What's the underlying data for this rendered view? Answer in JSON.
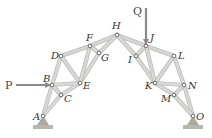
{
  "figure": {
    "type": "truss",
    "colors": {
      "member": "#d6d8d4",
      "member_edge": "#b7b9b4",
      "node": "#ffffff",
      "node_edge": "#555555",
      "arrow": "#8a8a8a",
      "support": "#a9a9a2",
      "ground": "#b8b6ad"
    },
    "nodes": [
      {
        "id": "A",
        "label": "A",
        "x": 43,
        "y": 116,
        "lx": 33,
        "ly": 120
      },
      {
        "id": "B",
        "label": "B",
        "x": 52,
        "y": 85,
        "lx": 43,
        "ly": 82
      },
      {
        "id": "C",
        "label": "C",
        "x": 61,
        "y": 95,
        "lx": 64,
        "ly": 102
      },
      {
        "id": "D",
        "label": "D",
        "x": 61,
        "y": 56,
        "lx": 51,
        "ly": 59
      },
      {
        "id": "E",
        "label": "E",
        "x": 80,
        "y": 83,
        "lx": 83,
        "ly": 89
      },
      {
        "id": "F",
        "label": "F",
        "x": 90,
        "y": 46,
        "lx": 86,
        "ly": 41
      },
      {
        "id": "G",
        "label": "G",
        "x": 99,
        "y": 53,
        "lx": 101,
        "ly": 61
      },
      {
        "id": "H",
        "label": "H",
        "x": 117,
        "y": 35,
        "lx": 112,
        "ly": 29
      },
      {
        "id": "I",
        "label": "I",
        "x": 136,
        "y": 56,
        "lx": 128,
        "ly": 63
      },
      {
        "id": "J",
        "label": "J",
        "x": 146,
        "y": 46,
        "lx": 150,
        "ly": 41
      },
      {
        "id": "K",
        "label": "K",
        "x": 155,
        "y": 83,
        "lx": 145,
        "ly": 89
      },
      {
        "id": "L",
        "label": "L",
        "x": 174,
        "y": 56,
        "lx": 178,
        "ly": 59
      },
      {
        "id": "M",
        "label": "M",
        "x": 174,
        "y": 95,
        "lx": 161,
        "ly": 102
      },
      {
        "id": "N",
        "label": "N",
        "x": 184,
        "y": 85,
        "lx": 188,
        "ly": 89
      },
      {
        "id": "O",
        "label": "O",
        "x": 193,
        "y": 116,
        "lx": 196,
        "ly": 120
      }
    ],
    "members": [
      [
        "A",
        "B"
      ],
      [
        "B",
        "D"
      ],
      [
        "D",
        "F"
      ],
      [
        "F",
        "H"
      ],
      [
        "H",
        "J"
      ],
      [
        "J",
        "L"
      ],
      [
        "L",
        "N"
      ],
      [
        "N",
        "O"
      ],
      [
        "A",
        "C"
      ],
      [
        "C",
        "E"
      ],
      [
        "E",
        "G"
      ],
      [
        "G",
        "H"
      ],
      [
        "H",
        "I"
      ],
      [
        "I",
        "K"
      ],
      [
        "K",
        "M"
      ],
      [
        "M",
        "O"
      ],
      [
        "B",
        "C"
      ],
      [
        "B",
        "E"
      ],
      [
        "D",
        "E"
      ],
      [
        "F",
        "E"
      ],
      [
        "F",
        "G"
      ],
      [
        "I",
        "J"
      ],
      [
        "J",
        "K"
      ],
      [
        "L",
        "K"
      ],
      [
        "K",
        "N"
      ],
      [
        "M",
        "N"
      ]
    ],
    "loads": [
      {
        "label": "P",
        "direction": "right",
        "x1": 16,
        "y1": 85,
        "x2": 50,
        "y2": 85,
        "lx": 5,
        "ly": 89
      },
      {
        "label": "Q",
        "direction": "down",
        "x1": 146,
        "y1": 8,
        "x2": 146,
        "y2": 44,
        "lx": 133,
        "ly": 15
      }
    ],
    "supports": [
      {
        "node": "A",
        "type": "pin"
      },
      {
        "node": "O",
        "type": "pin"
      }
    ]
  }
}
